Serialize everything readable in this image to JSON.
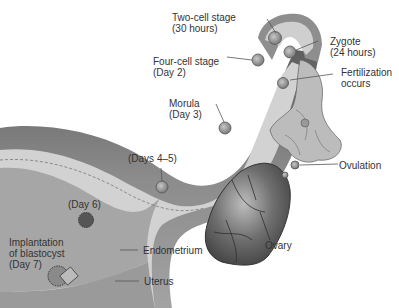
{
  "diagram": {
    "labels": {
      "two_cell": {
        "line1": "Two-cell stage",
        "line2": "(30 hours)"
      },
      "zygote": {
        "line1": "Zygote",
        "line2": "(24 hours)"
      },
      "four_cell": {
        "line1": "Four-cell stage",
        "line2": "(Day 2)"
      },
      "fertilization": {
        "line1": "Fertilization",
        "line2": "occurs"
      },
      "morula": {
        "line1": "Morula",
        "line2": "(Day 3)"
      },
      "days_4_5": {
        "line1": "(Days 4–5)"
      },
      "ovulation": {
        "line1": "Ovulation"
      },
      "day_6": {
        "line1": "(Day 6)"
      },
      "implantation": {
        "line1": "Implantation",
        "line2": "of blastocyst",
        "line3": "(Day 7)"
      },
      "endometrium": {
        "line1": "Endometrium"
      },
      "ovary": {
        "line1": "Ovary"
      },
      "uterus": {
        "line1": "Uterus"
      }
    },
    "structures": [
      "uterus",
      "endometrium",
      "uterine-tube",
      "fimbriae",
      "ovary"
    ],
    "stages": [
      "ovulation",
      "fertilization",
      "zygote",
      "two-cell stage",
      "four-cell stage",
      "morula",
      "blastocyst (days 4-5)",
      "blastocyst (day 6)",
      "implantation (day 7)"
    ]
  },
  "colors": {
    "tissue_dark": "#6e6e6e",
    "tissue_mid": "#a9a9a9",
    "tissue_light": "#d6d6d6",
    "lumen": "#e6e6e6",
    "text": "#333333",
    "leader": "#555555"
  }
}
